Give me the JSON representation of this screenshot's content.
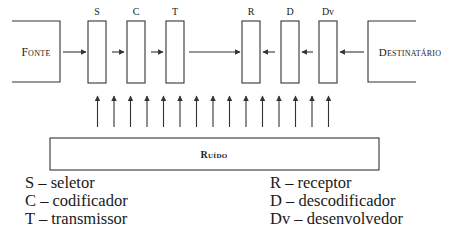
{
  "diagram": {
    "source": {
      "label": "Fonte"
    },
    "destination": {
      "label": "Destinatário"
    },
    "noise": {
      "label": "Ruído",
      "arrow_count": 16
    },
    "sender_blocks": [
      {
        "id": "S",
        "label": "S"
      },
      {
        "id": "C",
        "label": "C"
      },
      {
        "id": "T",
        "label": "T"
      }
    ],
    "receiver_blocks": [
      {
        "id": "R",
        "label": "R"
      },
      {
        "id": "D",
        "label": "D"
      },
      {
        "id": "Dv",
        "label": "Dv"
      }
    ],
    "flows": [
      {
        "from": "Fonte",
        "to": "S"
      },
      {
        "from": "S",
        "to": "C"
      },
      {
        "from": "C",
        "to": "T"
      },
      {
        "from": "T",
        "to": "R"
      },
      {
        "from": "Dv",
        "to": "D"
      },
      {
        "from": "D",
        "to": "R"
      },
      {
        "from": "Destinatário",
        "to": "Dv"
      }
    ]
  },
  "legend": {
    "left": [
      "S – seletor",
      "C – codificador",
      "T – transmissor"
    ],
    "right": [
      "R – receptor",
      "D – descodificador",
      "Dv – desenvolvedor"
    ]
  },
  "colors": {
    "stroke": "#333333",
    "text": "#1a1a1a",
    "background": "#ffffff"
  }
}
